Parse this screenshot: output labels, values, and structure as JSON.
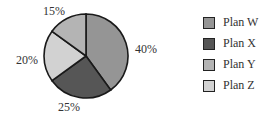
{
  "chart_data": {
    "type": "pie",
    "title": "",
    "categories": [
      "Plan W",
      "Plan X",
      "Plan Y",
      "Plan Z"
    ],
    "values": [
      40,
      25,
      20,
      15
    ],
    "labels": [
      "40%",
      "25%",
      "20%",
      "15%"
    ],
    "colors": [
      "#959595",
      "#565656",
      "#d2d2d2",
      "#b4b4b4"
    ],
    "legend_position": "right",
    "note": "Slices clockwise from 12 o'clock: Plan W 40%, Plan X 25%, Plan Z 20%, Plan Y 15%"
  },
  "legend": {
    "items": [
      {
        "label": "Plan W",
        "color": "#959595"
      },
      {
        "label": "Plan X",
        "color": "#565656"
      },
      {
        "label": "Plan Y",
        "color": "#b4b4b4"
      },
      {
        "label": "Plan Z",
        "color": "#d2d2d2"
      }
    ]
  },
  "slice_labels": {
    "w": "40%",
    "x": "25%",
    "z": "20%",
    "y": "15%"
  }
}
